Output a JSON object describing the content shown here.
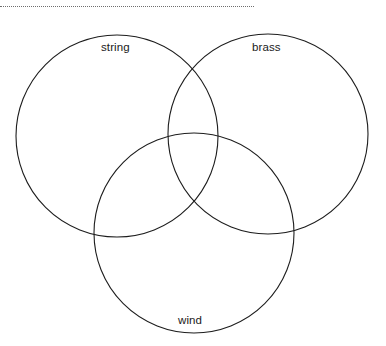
{
  "page": {
    "background_color": "#ffffff",
    "width": 386,
    "height": 346
  },
  "divider": {
    "name": "dotted-horizontal-rule",
    "style": "dotted",
    "color": "#6e6e6e"
  },
  "diagram": {
    "type": "venn",
    "set_count": 3,
    "stroke_color": "#1d1d1d",
    "fill": "none",
    "sets": [
      {
        "id": "string",
        "label": "string",
        "position": "top-left",
        "cx": 117,
        "cy": 136,
        "r": 101
      },
      {
        "id": "brass",
        "label": "brass",
        "position": "top-right",
        "cx": 268,
        "cy": 134,
        "r": 100
      },
      {
        "id": "wind",
        "label": "wind",
        "position": "bottom-center",
        "cx": 194,
        "cy": 233,
        "r": 100
      }
    ]
  }
}
